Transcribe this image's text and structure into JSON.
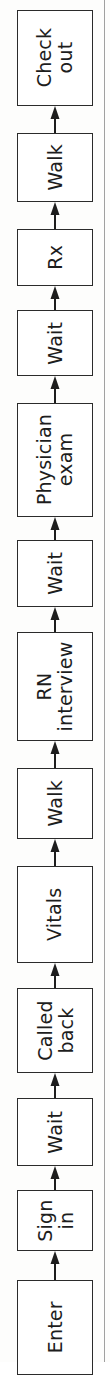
{
  "figure": {
    "type": "flowchart",
    "orientation": "rotated-90-ccw",
    "reading_direction": "bottom-to-top",
    "title": "",
    "colors": {
      "box_stroke": "#2b2b2b",
      "box_fill": "#ffffff",
      "arrow": "#1d1d1d",
      "page_background": "#fdfdfc",
      "page_edge_rule": "#8f8f8f"
    },
    "page_edge_rule": {
      "name": "page-edge-rule",
      "x": 104
    }
  },
  "steps": [
    {
      "id": "check-out",
      "label": "Check\nout",
      "top": 10,
      "height": 96,
      "lines": 2
    },
    {
      "id": "walk-2",
      "label": "Walk",
      "top": 133,
      "height": 69,
      "lines": 1
    },
    {
      "id": "rx",
      "label": "Rx",
      "top": 229,
      "height": 57,
      "lines": 1
    },
    {
      "id": "wait-3",
      "label": "Wait",
      "top": 310,
      "height": 66,
      "lines": 1
    },
    {
      "id": "physician-exam",
      "label": "Physician\nexam",
      "top": 403,
      "height": 114,
      "lines": 2
    },
    {
      "id": "wait-2",
      "label": "Wait",
      "top": 540,
      "height": 67,
      "lines": 1
    },
    {
      "id": "rn-interview",
      "label": "RN\ninterview",
      "top": 632,
      "height": 109,
      "lines": 2
    },
    {
      "id": "walk-1",
      "label": "Walk",
      "top": 768,
      "height": 71,
      "lines": 1
    },
    {
      "id": "vitals",
      "label": "Vitals",
      "top": 866,
      "height": 97,
      "lines": 1
    },
    {
      "id": "called-back",
      "label": "Called\nback",
      "top": 988,
      "height": 85,
      "lines": 2
    },
    {
      "id": "wait-1",
      "label": "Wait",
      "top": 1098,
      "height": 68,
      "lines": 1
    },
    {
      "id": "sign-in",
      "label": "Sign\nin",
      "top": 1190,
      "height": 61,
      "lines": 2
    },
    {
      "id": "enter",
      "label": "Enter",
      "top": 1280,
      "height": 95,
      "lines": 1
    }
  ],
  "connectors": [
    {
      "id": "enter-to-sign-in",
      "from": "enter",
      "to": "sign-in",
      "top": 1251,
      "height": 29
    },
    {
      "id": "sign-in-to-wait-1",
      "from": "sign-in",
      "to": "wait-1",
      "top": 1166,
      "height": 24
    },
    {
      "id": "wait-1-to-called-back",
      "from": "wait-1",
      "to": "called-back",
      "top": 1073,
      "height": 25
    },
    {
      "id": "called-back-to-vitals",
      "from": "called-back",
      "to": "vitals",
      "top": 963,
      "height": 25
    },
    {
      "id": "vitals-to-walk-1",
      "from": "vitals",
      "to": "walk-1",
      "top": 839,
      "height": 27
    },
    {
      "id": "walk-1-to-rn-interview",
      "from": "walk-1",
      "to": "rn-interview",
      "top": 741,
      "height": 27
    },
    {
      "id": "rn-interview-to-wait-2",
      "from": "rn-interview",
      "to": "wait-2",
      "top": 607,
      "height": 25
    },
    {
      "id": "wait-2-to-physician-exam",
      "from": "wait-2",
      "to": "physician-exam",
      "top": 517,
      "height": 23
    },
    {
      "id": "physician-exam-to-wait-3",
      "from": "physician-exam",
      "to": "wait-3",
      "top": 376,
      "height": 27
    },
    {
      "id": "wait-3-to-rx",
      "from": "wait-3",
      "to": "rx",
      "top": 286,
      "height": 24
    },
    {
      "id": "rx-to-walk-2",
      "from": "rx",
      "to": "walk-2",
      "top": 202,
      "height": 27
    },
    {
      "id": "walk-2-to-check-out",
      "from": "walk-2",
      "to": "check-out",
      "top": 106,
      "height": 27
    }
  ],
  "sequence_in_reading_order": [
    "Enter",
    "Sign in",
    "Wait",
    "Called back",
    "Vitals",
    "Walk",
    "RN interview",
    "Wait",
    "Physician exam",
    "Wait",
    "Rx",
    "Walk",
    "Check out"
  ]
}
